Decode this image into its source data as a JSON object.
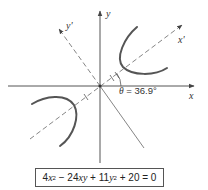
{
  "diagram": {
    "axes": {
      "x_label": "x",
      "y_label": "y",
      "x_prime_label": "x'",
      "y_prime_label": "y'"
    },
    "angle": {
      "symbol": "θ",
      "equals": " = ",
      "value": "36.9°"
    },
    "equation": {
      "t1_coef": "4",
      "t1_var": "x",
      "t1_exp": "2",
      "op1": " − ",
      "t2_coef": "24",
      "t2_var": "xy",
      "op2": " + ",
      "t3_coef": "11",
      "t3_var": "y",
      "t3_exp": "2",
      "op3": " + 20 = 0",
      "full_text": "4x² − 24xy + 11y² + 20 = 0"
    },
    "colors": {
      "axis": "#555555",
      "curve": "#555555",
      "dashed": "#777777",
      "text": "#333333"
    }
  }
}
